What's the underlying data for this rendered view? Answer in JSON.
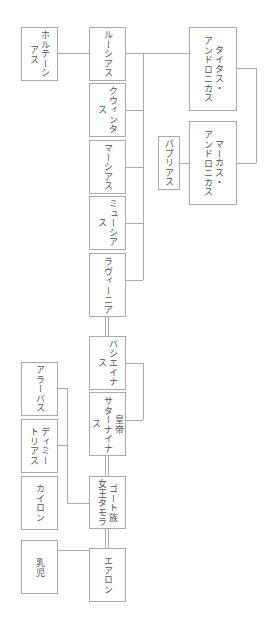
{
  "diagram": {
    "type": "family-tree",
    "orientation": "rotated-90",
    "nodes": {
      "hortensia": "ホルテーシアス",
      "licinius": "ルーシアス",
      "quintus": "クウィンタス",
      "marcus_son": "マーシアス",
      "mucius": "ミューシアス",
      "lavinia": "ラヴィーニア",
      "titus": "タイタス・\nアンドロニカス",
      "marcus": "マーカス・\nアンドロニカス",
      "publius": "パブリアス",
      "bassianus": "バシエイナス",
      "saturninus": "皇帝\nサターナイナス",
      "tamora": "ゴート族\n女王タモラ",
      "alarbus": "アラーバス",
      "demetrius": "ディミー\nトリアス",
      "chiron": "カイロン",
      "baby": "乳児",
      "aaron": "エアロン"
    }
  }
}
